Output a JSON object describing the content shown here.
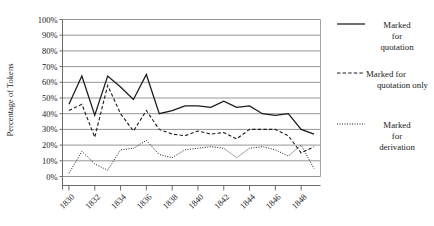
{
  "chart_data": {
    "type": "line",
    "title": "",
    "xlabel": "",
    "ylabel": "Percentage of Tokens",
    "ylim": [
      0,
      100
    ],
    "yticks": [
      "0%",
      "10%",
      "20%",
      "30%",
      "40%",
      "50%",
      "60%",
      "70%",
      "80%",
      "90%",
      "100%"
    ],
    "ytick_values": [
      0,
      10,
      20,
      30,
      40,
      50,
      60,
      70,
      80,
      90,
      100
    ],
    "xlim": [
      1829.5,
      1849.5
    ],
    "x": [
      1830,
      1831,
      1832,
      1833,
      1834,
      1835,
      1836,
      1837,
      1838,
      1839,
      1840,
      1841,
      1842,
      1843,
      1844,
      1845,
      1846,
      1847,
      1848,
      1849
    ],
    "xticks": [
      "1830",
      "1832",
      "1834",
      "1836",
      "1838",
      "1840",
      "1842",
      "1844",
      "1846",
      "1848"
    ],
    "xtick_values": [
      1830,
      1832,
      1834,
      1836,
      1838,
      1840,
      1842,
      1844,
      1846,
      1848
    ],
    "grid": true,
    "legend_position": "right",
    "series": [
      {
        "name": "Marked for quotation",
        "style": "solid",
        "color": "#1a1a1a",
        "values": [
          46,
          64,
          39,
          64,
          57,
          49,
          65,
          40,
          42,
          45,
          45,
          44,
          48,
          44,
          45,
          40,
          39,
          40,
          30,
          27
        ]
      },
      {
        "name": "Marked for quotation only",
        "style": "dashed",
        "color": "#1a1a1a",
        "values": [
          42,
          46,
          25,
          58,
          40,
          29,
          42,
          30,
          27,
          26,
          29,
          27,
          28,
          24,
          30,
          30,
          30,
          26,
          15,
          19
        ]
      },
      {
        "name": "Marked for derivation",
        "style": "dotted",
        "color": "#1a1a1a",
        "values": [
          2,
          16,
          8,
          4,
          17,
          18,
          23,
          14,
          12,
          17,
          18,
          19,
          18,
          12,
          18,
          19,
          17,
          13,
          20,
          5
        ]
      }
    ]
  },
  "legend": {
    "items": [
      {
        "label_lines": [
          "Marked",
          "for",
          "quotation"
        ],
        "style": "solid"
      },
      {
        "label_lines": [
          "Marked for",
          "quotation only"
        ],
        "style": "dashed"
      },
      {
        "label_lines": [
          "Marked",
          "for",
          "derivation"
        ],
        "style": "dotted"
      }
    ],
    "item_0_line_0": "Marked",
    "item_0_line_1": "for",
    "item_0_line_2": "quotation",
    "item_1_line_0": "Marked for",
    "item_1_line_1": "quotation only",
    "item_2_line_0": "Marked",
    "item_2_line_1": "for",
    "item_2_line_2": "derivation"
  },
  "axes": {
    "ylabel": "Percentage of Tokens"
  }
}
